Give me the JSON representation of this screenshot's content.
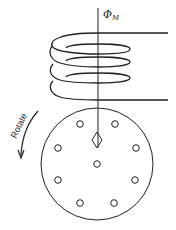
{
  "diagram": {
    "flux_label": "Φ",
    "flux_subscript": "M",
    "rotate_label": "Rotate",
    "colors": {
      "stroke": "#222222",
      "background": "#ffffff"
    },
    "coil": {
      "turns": 4
    },
    "disk": {
      "holes": 9
    }
  }
}
